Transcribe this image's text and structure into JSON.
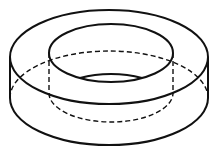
{
  "figure": {
    "stroke_color": "#111111",
    "background": "#ffffff",
    "outer": {
      "cx": 109,
      "top_cy": 57,
      "bottom_cy": 98,
      "rx": 99,
      "ry": 47
    },
    "inner": {
      "cx": 111,
      "top_cy": 53,
      "bottom_cy": 93,
      "rx": 62,
      "ry": 29
    },
    "hidden_lines": "dashed"
  }
}
